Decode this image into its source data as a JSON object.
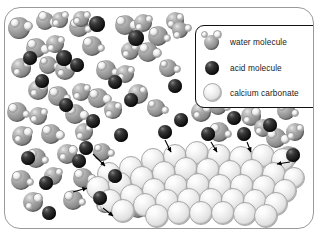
{
  "figure": {
    "caption": ""
  },
  "legend": {
    "items": [
      {
        "swatch": "water-molecule-sphere",
        "label": "water molecule",
        "color": "#8e8e8e"
      },
      {
        "swatch": "acid-molecule-sphere",
        "label": "acid molecule",
        "color": "#141414"
      },
      {
        "swatch": "calcium-carbonate-sphere",
        "label": "calcium carbonate",
        "color": "#eeeeee"
      }
    ]
  },
  "particles": {
    "water": [
      {
        "x": 14,
        "y": 20,
        "r": 11,
        "h1": [
          -4,
          -5,
          5
        ],
        "h2": [
          9,
          -2,
          5
        ]
      },
      {
        "x": 40,
        "y": 13,
        "r": 9,
        "h1": [
          -2,
          -5,
          5
        ],
        "h2": [
          9,
          1,
          5
        ]
      },
      {
        "x": 55,
        "y": 12,
        "r": 8,
        "h1": [
          5,
          -5,
          4
        ],
        "h2": [
          -4,
          3,
          4
        ]
      },
      {
        "x": 74,
        "y": 19,
        "r": 10,
        "h1": [
          -4,
          -4,
          5
        ],
        "h2": [
          9,
          2,
          4
        ]
      },
      {
        "x": 76,
        "y": 11,
        "r": 8,
        "h1": [
          6,
          -4,
          4
        ],
        "h2": [
          -4,
          2,
          4
        ]
      },
      {
        "x": 120,
        "y": 17,
        "r": 10,
        "h1": [
          -4,
          -4,
          5
        ],
        "h2": [
          9,
          0,
          5
        ]
      },
      {
        "x": 138,
        "y": 15,
        "r": 9,
        "h1": [
          6,
          -4,
          4
        ],
        "h2": [
          -4,
          4,
          4
        ]
      },
      {
        "x": 153,
        "y": 28,
        "r": 10,
        "h1": [
          -4,
          -4,
          5
        ],
        "h2": [
          9,
          2,
          4
        ]
      },
      {
        "x": 170,
        "y": 13,
        "r": 9,
        "h1": [
          5,
          -4,
          4
        ],
        "h2": [
          -4,
          3,
          4
        ]
      },
      {
        "x": 175,
        "y": 22,
        "r": 8,
        "h1": [
          -3,
          5,
          4
        ],
        "h2": [
          8,
          -2,
          4
        ]
      },
      {
        "x": 31,
        "y": 40,
        "r": 10,
        "h1": [
          -4,
          -4,
          5
        ],
        "h2": [
          9,
          1,
          5
        ]
      },
      {
        "x": 50,
        "y": 36,
        "r": 9,
        "h1": [
          6,
          -4,
          4
        ],
        "h2": [
          -4,
          4,
          4
        ]
      },
      {
        "x": 87,
        "y": 38,
        "r": 10,
        "h1": [
          -4,
          -4,
          5
        ],
        "h2": [
          9,
          2,
          4
        ]
      },
      {
        "x": 125,
        "y": 43,
        "r": 9,
        "h1": [
          5,
          -4,
          4
        ],
        "h2": [
          -4,
          3,
          4
        ]
      },
      {
        "x": 143,
        "y": 44,
        "r": 10,
        "h1": [
          -4,
          -4,
          5
        ],
        "h2": [
          9,
          1,
          5
        ]
      },
      {
        "x": 16,
        "y": 60,
        "r": 10,
        "h1": [
          6,
          -4,
          4
        ],
        "h2": [
          -4,
          4,
          4
        ]
      },
      {
        "x": 43,
        "y": 57,
        "r": 9,
        "h1": [
          -4,
          -4,
          4
        ],
        "h2": [
          9,
          1,
          4
        ]
      },
      {
        "x": 60,
        "y": 62,
        "r": 10,
        "h1": [
          5,
          -4,
          5
        ],
        "h2": [
          -4,
          3,
          4
        ]
      },
      {
        "x": 101,
        "y": 62,
        "r": 10,
        "h1": [
          -4,
          -4,
          5
        ],
        "h2": [
          9,
          2,
          4
        ]
      },
      {
        "x": 120,
        "y": 66,
        "r": 9,
        "h1": [
          6,
          -4,
          4
        ],
        "h2": [
          -4,
          3,
          4
        ]
      },
      {
        "x": 163,
        "y": 60,
        "r": 9,
        "h1": [
          -4,
          -4,
          4
        ],
        "h2": [
          9,
          1,
          4
        ]
      },
      {
        "x": 33,
        "y": 82,
        "r": 10,
        "h1": [
          5,
          -4,
          5
        ],
        "h2": [
          -4,
          3,
          4
        ]
      },
      {
        "x": 53,
        "y": 88,
        "r": 10,
        "h1": [
          -4,
          -4,
          5
        ],
        "h2": [
          9,
          2,
          4
        ]
      },
      {
        "x": 76,
        "y": 84,
        "r": 9,
        "h1": [
          6,
          -4,
          4
        ],
        "h2": [
          -4,
          4,
          4
        ]
      },
      {
        "x": 93,
        "y": 90,
        "r": 10,
        "h1": [
          -4,
          -4,
          5
        ],
        "h2": [
          9,
          1,
          5
        ]
      },
      {
        "x": 133,
        "y": 86,
        "r": 10,
        "h1": [
          5,
          -4,
          4
        ],
        "h2": [
          -4,
          3,
          4
        ]
      },
      {
        "x": 12,
        "y": 104,
        "r": 10,
        "h1": [
          -4,
          -4,
          5
        ],
        "h2": [
          9,
          2,
          4
        ]
      },
      {
        "x": 33,
        "y": 108,
        "r": 9,
        "h1": [
          6,
          -4,
          4
        ],
        "h2": [
          -4,
          3,
          4
        ]
      },
      {
        "x": 70,
        "y": 106,
        "r": 10,
        "h1": [
          -4,
          -4,
          5
        ],
        "h2": [
          9,
          1,
          5
        ]
      },
      {
        "x": 108,
        "y": 102,
        "r": 9,
        "h1": [
          5,
          -4,
          4
        ],
        "h2": [
          -4,
          4,
          4
        ]
      },
      {
        "x": 151,
        "y": 100,
        "r": 9,
        "h1": [
          -4,
          -4,
          4
        ],
        "h2": [
          9,
          2,
          4
        ]
      },
      {
        "x": 196,
        "y": 104,
        "r": 10,
        "h1": [
          6,
          -4,
          5
        ],
        "h2": [
          -4,
          3,
          4
        ]
      },
      {
        "x": 213,
        "y": 98,
        "r": 9,
        "h1": [
          -4,
          -4,
          4
        ],
        "h2": [
          9,
          1,
          4
        ]
      },
      {
        "x": 246,
        "y": 108,
        "r": 10,
        "h1": [
          5,
          -4,
          5
        ],
        "h2": [
          -4,
          4,
          4
        ]
      },
      {
        "x": 281,
        "y": 103,
        "r": 9,
        "h1": [
          -4,
          -4,
          4
        ],
        "h2": [
          9,
          2,
          4
        ]
      },
      {
        "x": 17,
        "y": 128,
        "r": 10,
        "h1": [
          6,
          -4,
          5
        ],
        "h2": [
          -4,
          3,
          4
        ]
      },
      {
        "x": 46,
        "y": 126,
        "r": 10,
        "h1": [
          -4,
          -4,
          5
        ],
        "h2": [
          9,
          1,
          5
        ]
      },
      {
        "x": 79,
        "y": 124,
        "r": 9,
        "h1": [
          5,
          -4,
          4
        ],
        "h2": [
          -4,
          4,
          4
        ]
      },
      {
        "x": 214,
        "y": 124,
        "r": 10,
        "h1": [
          -4,
          -4,
          5
        ],
        "h2": [
          9,
          2,
          4
        ]
      },
      {
        "x": 258,
        "y": 120,
        "r": 9,
        "h1": [
          6,
          -4,
          4
        ],
        "h2": [
          -4,
          3,
          4
        ]
      },
      {
        "x": 271,
        "y": 130,
        "r": 10,
        "h1": [
          -4,
          -4,
          5
        ],
        "h2": [
          9,
          1,
          5
        ]
      },
      {
        "x": 290,
        "y": 124,
        "r": 9,
        "h1": [
          5,
          -4,
          4
        ],
        "h2": [
          -4,
          4,
          4
        ]
      },
      {
        "x": 31,
        "y": 150,
        "r": 10,
        "h1": [
          -4,
          -4,
          5
        ],
        "h2": [
          9,
          2,
          4
        ]
      },
      {
        "x": 62,
        "y": 146,
        "r": 10,
        "h1": [
          6,
          -4,
          5
        ],
        "h2": [
          -4,
          3,
          4
        ]
      },
      {
        "x": 97,
        "y": 144,
        "r": 9,
        "h1": [
          -4,
          -4,
          4
        ],
        "h2": [
          9,
          1,
          4
        ]
      },
      {
        "x": 283,
        "y": 148,
        "r": 10,
        "h1": [
          5,
          -4,
          5
        ],
        "h2": [
          -4,
          4,
          4
        ]
      },
      {
        "x": 16,
        "y": 172,
        "r": 10,
        "h1": [
          -4,
          -4,
          5
        ],
        "h2": [
          9,
          2,
          4
        ]
      },
      {
        "x": 48,
        "y": 168,
        "r": 9,
        "h1": [
          6,
          -4,
          4
        ],
        "h2": [
          -4,
          3,
          4
        ]
      },
      {
        "x": 78,
        "y": 170,
        "r": 10,
        "h1": [
          -4,
          -4,
          5
        ],
        "h2": [
          9,
          1,
          5
        ]
      },
      {
        "x": 28,
        "y": 194,
        "r": 10,
        "h1": [
          5,
          -4,
          5
        ],
        "h2": [
          -4,
          4,
          4
        ]
      },
      {
        "x": 68,
        "y": 192,
        "r": 10,
        "h1": [
          -4,
          -4,
          5
        ],
        "h2": [
          9,
          2,
          4
        ]
      },
      {
        "x": 100,
        "y": 196,
        "r": 9,
        "h1": [
          6,
          -4,
          4
        ],
        "h2": [
          -4,
          3,
          4
        ]
      },
      {
        "x": 133,
        "y": 200,
        "r": 10,
        "h1": [
          -4,
          -4,
          5
        ],
        "h2": [
          9,
          1,
          5
        ]
      }
    ],
    "acid": [
      {
        "x": 92,
        "y": 16,
        "r": 8
      },
      {
        "x": 131,
        "y": 30,
        "r": 8
      },
      {
        "x": 25,
        "y": 50,
        "r": 7
      },
      {
        "x": 59,
        "y": 50,
        "r": 8
      },
      {
        "x": 72,
        "y": 57,
        "r": 7
      },
      {
        "x": 37,
        "y": 73,
        "r": 7
      },
      {
        "x": 110,
        "y": 74,
        "r": 7
      },
      {
        "x": 170,
        "y": 78,
        "r": 7
      },
      {
        "x": 61,
        "y": 97,
        "r": 7
      },
      {
        "x": 126,
        "y": 92,
        "r": 7
      },
      {
        "x": 88,
        "y": 113,
        "r": 7
      },
      {
        "x": 176,
        "y": 112,
        "r": 7
      },
      {
        "x": 229,
        "y": 110,
        "r": 7
      },
      {
        "x": 265,
        "y": 117,
        "r": 7
      },
      {
        "x": 23,
        "y": 150,
        "r": 7
      },
      {
        "x": 41,
        "y": 175,
        "r": 7
      },
      {
        "x": 74,
        "y": 153,
        "r": 7
      },
      {
        "x": 95,
        "y": 190,
        "r": 7
      },
      {
        "x": 44,
        "y": 205,
        "r": 7
      },
      {
        "x": 81,
        "y": 140,
        "r": 7
      },
      {
        "x": 116,
        "y": 127,
        "r": 7
      },
      {
        "x": 160,
        "y": 124,
        "r": 7
      },
      {
        "x": 203,
        "y": 126,
        "r": 7
      },
      {
        "x": 239,
        "y": 126,
        "r": 7
      },
      {
        "x": 288,
        "y": 147,
        "r": 7
      },
      {
        "x": 110,
        "y": 168,
        "r": 7
      }
    ],
    "crystal": [
      {
        "x": 104,
        "y": 166,
        "r": 12
      },
      {
        "x": 126,
        "y": 160,
        "r": 12
      },
      {
        "x": 148,
        "y": 152,
        "r": 12
      },
      {
        "x": 170,
        "y": 148,
        "r": 12
      },
      {
        "x": 192,
        "y": 145,
        "r": 12
      },
      {
        "x": 214,
        "y": 148,
        "r": 12
      },
      {
        "x": 236,
        "y": 150,
        "r": 12
      },
      {
        "x": 258,
        "y": 148,
        "r": 12
      },
      {
        "x": 278,
        "y": 152,
        "r": 12
      },
      {
        "x": 93,
        "y": 180,
        "r": 12
      },
      {
        "x": 115,
        "y": 176,
        "r": 12
      },
      {
        "x": 137,
        "y": 170,
        "r": 12
      },
      {
        "x": 159,
        "y": 165,
        "r": 12
      },
      {
        "x": 181,
        "y": 161,
        "r": 12
      },
      {
        "x": 203,
        "y": 162,
        "r": 12
      },
      {
        "x": 225,
        "y": 164,
        "r": 12
      },
      {
        "x": 247,
        "y": 163,
        "r": 12
      },
      {
        "x": 269,
        "y": 166,
        "r": 12
      },
      {
        "x": 289,
        "y": 170,
        "r": 11
      },
      {
        "x": 105,
        "y": 193,
        "r": 12
      },
      {
        "x": 127,
        "y": 188,
        "r": 12
      },
      {
        "x": 149,
        "y": 182,
        "r": 12
      },
      {
        "x": 171,
        "y": 178,
        "r": 12
      },
      {
        "x": 193,
        "y": 177,
        "r": 12
      },
      {
        "x": 215,
        "y": 178,
        "r": 12
      },
      {
        "x": 237,
        "y": 178,
        "r": 12
      },
      {
        "x": 259,
        "y": 179,
        "r": 12
      },
      {
        "x": 280,
        "y": 183,
        "r": 12
      },
      {
        "x": 118,
        "y": 203,
        "r": 12
      },
      {
        "x": 140,
        "y": 197,
        "r": 12
      },
      {
        "x": 162,
        "y": 193,
        "r": 12
      },
      {
        "x": 184,
        "y": 192,
        "r": 12
      },
      {
        "x": 206,
        "y": 192,
        "r": 12
      },
      {
        "x": 228,
        "y": 192,
        "r": 12
      },
      {
        "x": 250,
        "y": 193,
        "r": 12
      },
      {
        "x": 271,
        "y": 196,
        "r": 12
      },
      {
        "x": 152,
        "y": 208,
        "r": 12
      },
      {
        "x": 174,
        "y": 205,
        "r": 12
      },
      {
        "x": 196,
        "y": 205,
        "r": 12
      },
      {
        "x": 218,
        "y": 205,
        "r": 12
      },
      {
        "x": 240,
        "y": 206,
        "r": 12
      },
      {
        "x": 261,
        "y": 208,
        "r": 12
      }
    ],
    "arrows": [
      {
        "x1": 88,
        "y1": 146,
        "x2": 100,
        "y2": 158
      },
      {
        "x1": 68,
        "y1": 184,
        "x2": 82,
        "y2": 180
      },
      {
        "x1": 98,
        "y1": 200,
        "x2": 108,
        "y2": 208
      },
      {
        "x1": 160,
        "y1": 132,
        "x2": 166,
        "y2": 144
      },
      {
        "x1": 206,
        "y1": 134,
        "x2": 212,
        "y2": 144
      },
      {
        "x1": 242,
        "y1": 134,
        "x2": 246,
        "y2": 144
      },
      {
        "x1": 285,
        "y1": 154,
        "x2": 272,
        "y2": 156
      }
    ]
  }
}
